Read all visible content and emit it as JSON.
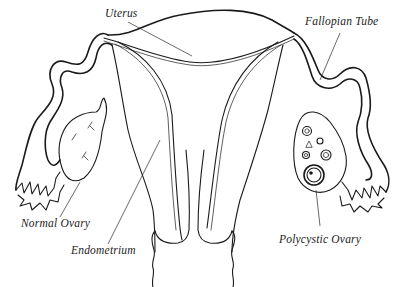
{
  "figure": {
    "type": "anatomical-line-drawing",
    "colors": {
      "background": "#ffffff",
      "ink": "#1a1a1a",
      "label": "#222222"
    }
  },
  "labels": {
    "uterus": "Uterus",
    "fallopian_tube": "Fallopian Tube",
    "normal_ovary": "Normal Ovary",
    "endometrium": "Endometrium",
    "polycystic_ovary": "Polycystic Ovary"
  }
}
